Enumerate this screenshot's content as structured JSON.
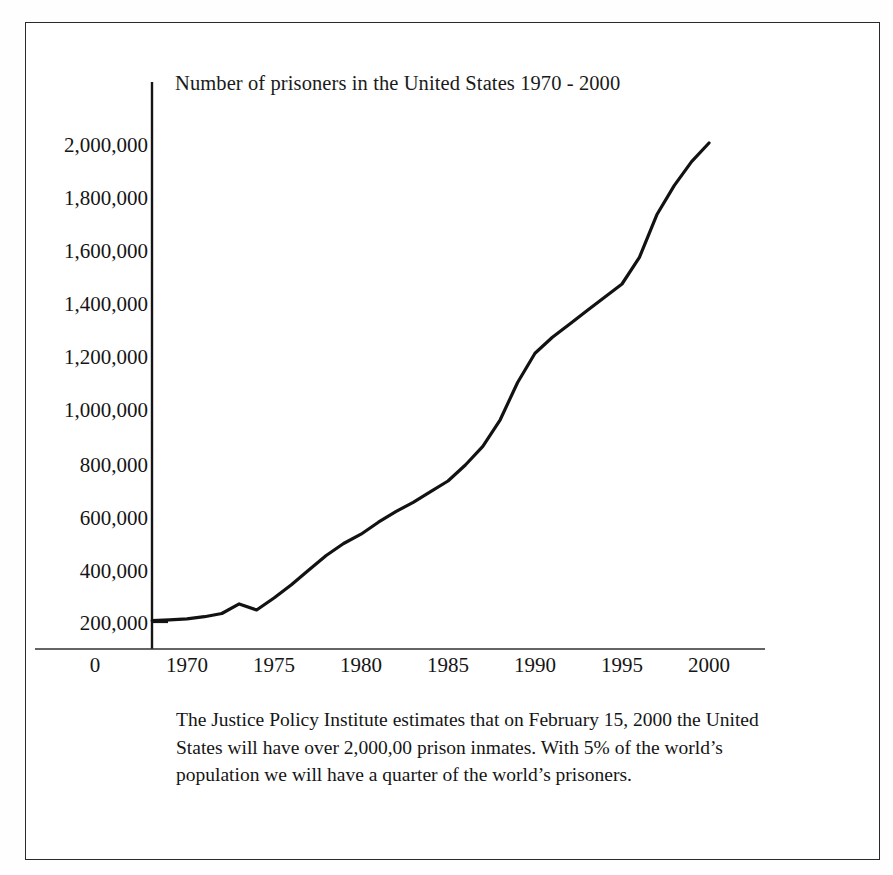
{
  "document": {
    "kind": "scanned-figure",
    "border_color": "#2a2a2a",
    "background": "#ffffff",
    "ink_color": "#111111"
  },
  "chart_data": {
    "type": "line",
    "title": "Number of prisoners in the United States 1970 - 2000",
    "xlabel": "",
    "ylabel": "",
    "xlim": [
      1968,
      2000
    ],
    "ylim": [
      0,
      2100000
    ],
    "grid": false,
    "legend": null,
    "x_tick_labels": [
      "0",
      "1970",
      "1975",
      "1980",
      "1985",
      "1990",
      "1995",
      "2000"
    ],
    "y_tick_labels": [
      "2,000,000",
      "1,800,000",
      "1,600,000",
      "1,400,000",
      "1,200,000",
      "1,000,000",
      "800,000",
      "600,000",
      "400,000",
      "200,000"
    ],
    "y_tick_values": [
      2000000,
      1800000,
      1600000,
      1400000,
      1200000,
      1000000,
      800000,
      600000,
      400000,
      200000
    ],
    "series": [
      {
        "name": "Number of prisoners",
        "color": "#121212",
        "x": [
          1968,
          1969,
          1970,
          1971,
          1972,
          1973,
          1974,
          1975,
          1976,
          1977,
          1978,
          1979,
          1980,
          1981,
          1982,
          1983,
          1984,
          1985,
          1986,
          1987,
          1988,
          1989,
          1990,
          1991,
          1992,
          1993,
          1994,
          1995,
          1996,
          1997,
          1998,
          1999,
          2000
        ],
        "values": [
          205000,
          208000,
          212000,
          220000,
          232000,
          268000,
          245000,
          290000,
          340000,
          395000,
          450000,
          495000,
          530000,
          575000,
          615000,
          650000,
          690000,
          730000,
          790000,
          860000,
          960000,
          1100000,
          1210000,
          1270000,
          1320000,
          1370000,
          1420000,
          1470000,
          1570000,
          1730000,
          1840000,
          1930000,
          2000000
        ]
      }
    ],
    "annotations": []
  },
  "caption": {
    "lines": [
      "The Justice Policy Institute estimates that on February 15, 2000 the United",
      "States will have over 2,000,00 prison inmates.  With 5% of the world’s",
      "population we will have a quarter of the world’s prisoners."
    ],
    "full_text": "The Justice Policy Institute estimates that on February 15, 2000 the United States will have over 2,000,00 prison inmates.  With 5% of the world’s population we will have a quarter of the world’s prisoners."
  }
}
